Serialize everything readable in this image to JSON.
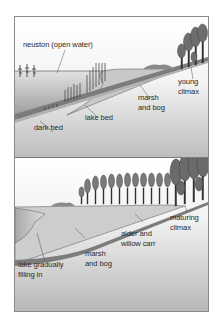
{
  "figure": {
    "panels": [
      {
        "id": "early-stage",
        "labels": {
          "neuston": "neuston (open water)",
          "dark_bed": "dark bed",
          "lake_bed": "lake bed",
          "marsh_1": "marsh",
          "marsh_2": "and bog",
          "climax_1": "young",
          "climax_2": "climax"
        }
      },
      {
        "id": "later-stage",
        "labels": {
          "lake_1": "lake gradually",
          "lake_2": "filling in",
          "marsh_1": "marsh",
          "marsh_2": "and bog",
          "carr_1": "alder and",
          "carr_2": "willow carr",
          "climax_1": "maturing",
          "climax_2": "climax"
        }
      }
    ],
    "colors": {
      "border": "#8a8a8a",
      "water_top": "#ffffff",
      "water_bottom": "#b8b8b8",
      "sediment": "#c4c4c4",
      "bed_line": "#5a5a5a",
      "ground": "#d6d6d6",
      "trees": "#6e6e6e",
      "text": "#2a2a2a"
    }
  }
}
